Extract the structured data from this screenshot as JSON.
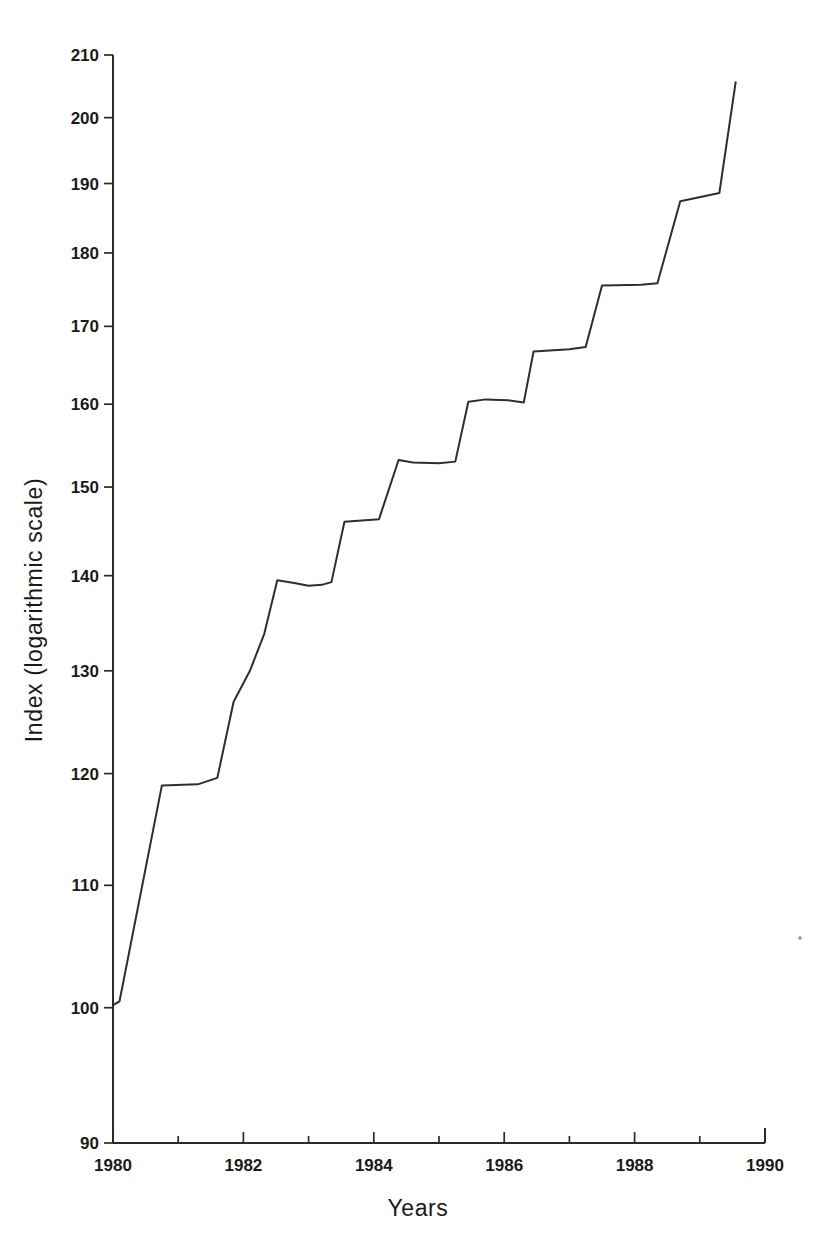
{
  "chart_data": {
    "type": "line",
    "title": "",
    "subtitle": "",
    "xlabel": "Years",
    "ylabel": "Index (logarithmic scale)",
    "yscale": "log",
    "xlim": [
      1980,
      1990
    ],
    "ylim": [
      90,
      210
    ],
    "grid": false,
    "legend": null,
    "y_tick_labels": [
      "210",
      "200",
      "190",
      "180",
      "170",
      "160",
      "150",
      "140",
      "130",
      "120",
      "110",
      "100",
      "90"
    ],
    "y_ticks": [
      210,
      200,
      190,
      180,
      170,
      160,
      150,
      140,
      130,
      120,
      110,
      100,
      90
    ],
    "x_tick_labels": [
      "1980",
      "1982",
      "1984",
      "1986",
      "1988",
      "1990"
    ],
    "x_ticks": [
      1980,
      1982,
      1984,
      1986,
      1988,
      1990
    ],
    "x_minor_ticks": [
      1981,
      1983,
      1985,
      1987,
      1989
    ],
    "line_color": "#2e2e2e",
    "series": [
      {
        "name": "Index",
        "x": [
          1980.0,
          1980.1,
          1980.75,
          1981.3,
          1981.45,
          1981.6,
          1981.85,
          1982.1,
          1982.32,
          1982.52,
          1982.78,
          1983.0,
          1983.2,
          1983.35,
          1983.55,
          1984.08,
          1984.38,
          1984.6,
          1985.0,
          1985.25,
          1985.45,
          1985.72,
          1986.05,
          1986.3,
          1986.45,
          1987.0,
          1987.25,
          1987.5,
          1988.1,
          1988.35,
          1988.7,
          1989.1,
          1989.3,
          1989.55
        ],
        "y": [
          100.2,
          100.5,
          118.9,
          119.0,
          119.3,
          119.6,
          126.9,
          130.0,
          133.8,
          139.5,
          139.2,
          138.9,
          139.0,
          139.3,
          146.0,
          146.3,
          153.2,
          152.9,
          152.8,
          153.0,
          160.3,
          160.6,
          160.5,
          160.2,
          166.7,
          167.0,
          167.3,
          175.5,
          175.6,
          175.8,
          187.4,
          188.2,
          188.6,
          205.6
        ]
      }
    ]
  },
  "axes": {
    "y_axis_title": "Index (logarithmic scale)",
    "x_axis_title": "Years"
  }
}
